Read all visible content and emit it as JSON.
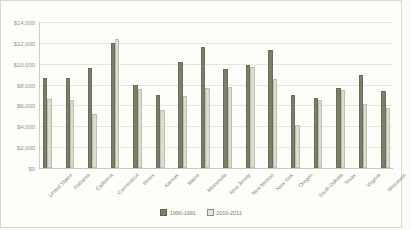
{
  "chart_data": {
    "type": "bar",
    "title": "",
    "subtitle": "",
    "xlabel": "",
    "ylabel": "",
    "ylim": [
      0,
      14000
    ],
    "ytick_labels": [
      "$14,000",
      "$12,000",
      "$10,000",
      "$8,000",
      "$6,000",
      "$4,000",
      "$2,000",
      "$0"
    ],
    "ytick_values": [
      14000,
      12000,
      10000,
      8000,
      6000,
      4000,
      2000,
      0
    ],
    "grid": true,
    "legend_position": "bottom-center",
    "categories": [
      "United States",
      "Alabama",
      "California",
      "Connecticut",
      "Illinois",
      "Kansas",
      "Maine",
      "Minnesota",
      "New Jersey",
      "New Mexico",
      "New York",
      "Oregon",
      "South Dakota",
      "Texas",
      "Virginia",
      "Wisconsin"
    ],
    "series": [
      {
        "name": "1990-1991",
        "color": "#7d7d6c",
        "values": [
          8600,
          8600,
          9600,
          12000,
          8000,
          7000,
          10200,
          11600,
          9500,
          9900,
          11300,
          7000,
          6700,
          7700,
          8900,
          7400
        ]
      },
      {
        "name": "2010-2011",
        "color": "#dcdccf",
        "values": [
          6600,
          6500,
          5200,
          12400,
          7600,
          5600,
          6900,
          7700,
          7800,
          9700,
          8500,
          4100,
          6500,
          7500,
          6100,
          5800
        ]
      }
    ]
  },
  "legend": {
    "items": [
      {
        "label": "1990-1991"
      },
      {
        "label": "2010-2011"
      }
    ]
  },
  "colors": {
    "series_1990": "#7d7d6c",
    "series_2010": "#dcdccf",
    "gridline": "#e6e6db",
    "text": "#8d8d80",
    "background": "#fdfdfa"
  }
}
